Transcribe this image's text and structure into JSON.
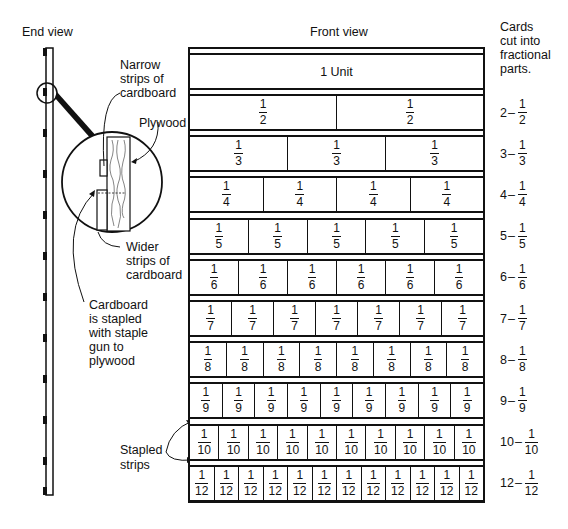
{
  "end_view": {
    "title": "End view",
    "callouts": {
      "narrow_strips": [
        "Narrow",
        "strips of",
        "cardboard"
      ],
      "plywood": "Plywood",
      "wider_strips": [
        "Wider",
        "strips of",
        "cardboard"
      ],
      "stapled": [
        "Cardboard",
        "is stapled",
        "with staple",
        "gun to",
        "plywood"
      ],
      "stapled_strips": [
        "Stapled",
        "strips"
      ]
    }
  },
  "front_view": {
    "title": "Front view",
    "unit_label": "1 Unit",
    "rows": [
      {
        "denominator": 2,
        "count": 2
      },
      {
        "denominator": 3,
        "count": 3
      },
      {
        "denominator": 4,
        "count": 4
      },
      {
        "denominator": 5,
        "count": 5
      },
      {
        "denominator": 6,
        "count": 6
      },
      {
        "denominator": 7,
        "count": 7
      },
      {
        "denominator": 8,
        "count": 8
      },
      {
        "denominator": 9,
        "count": 9
      },
      {
        "denominator": 10,
        "count": 10
      },
      {
        "denominator": 12,
        "count": 12
      }
    ]
  },
  "side_labels": {
    "header": [
      "Cards",
      "cut into",
      "fractional",
      "parts."
    ],
    "items": [
      {
        "count": "2",
        "num": "1",
        "den": "2"
      },
      {
        "count": "3",
        "num": "1",
        "den": "3"
      },
      {
        "count": "4",
        "num": "1",
        "den": "4"
      },
      {
        "count": "5",
        "num": "1",
        "den": "5"
      },
      {
        "count": "6",
        "num": "1",
        "den": "6"
      },
      {
        "count": "7",
        "num": "1",
        "den": "7"
      },
      {
        "count": "8",
        "num": "1",
        "den": "8"
      },
      {
        "count": "9",
        "num": "1",
        "den": "9"
      },
      {
        "count": "10",
        "num": "1",
        "den": "10"
      },
      {
        "count": "12",
        "num": "1",
        "den": "12"
      }
    ],
    "dash": "–"
  }
}
